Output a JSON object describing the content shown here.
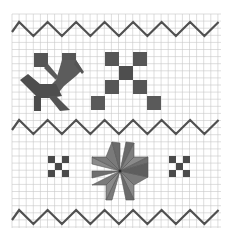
{
  "image": {
    "description": "Hand-drawn embroidery pattern on graph paper",
    "grid": {
      "x0": 12,
      "y0": 14,
      "x1": 221,
      "y1": 228,
      "cell": 7.1,
      "color": "#c8c8c8"
    },
    "ink": {
      "dark": "#4a4a4a",
      "mid": "#6e6e6e",
      "light": "#8c8c8c",
      "line": "#505050"
    },
    "zigzags": [
      {
        "name": "top-zigzag",
        "y_peak": 22,
        "y_valley": 36,
        "x_start": 12,
        "x_end": 220,
        "period": 28.5
      },
      {
        "name": "middle-zigzag",
        "y_peak": 120,
        "y_valley": 134,
        "x_start": 12,
        "x_end": 220,
        "period": 28.5
      },
      {
        "name": "bottom-zigzag",
        "y_peak": 210,
        "y_valley": 224,
        "x_start": 12,
        "x_end": 220,
        "period": 28.5
      }
    ],
    "motifs": [
      {
        "name": "bird-motif",
        "x": 20,
        "y": 50
      },
      {
        "name": "x-cross-motif",
        "x": 91,
        "y": 51
      },
      {
        "name": "small-cross-left",
        "x": 48,
        "y": 156
      },
      {
        "name": "eight-point-star",
        "x": 120,
        "y": 170
      },
      {
        "name": "small-cross-right",
        "x": 170,
        "y": 156
      }
    ]
  }
}
